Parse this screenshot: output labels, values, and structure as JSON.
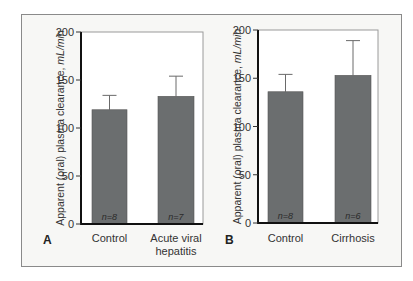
{
  "chart_data": [
    {
      "type": "bar",
      "panel": "A",
      "title": "",
      "ylabel": "Apparent (oral) plasma clearance, mL/min",
      "ylabel_plain": "Apparent (oral) plasma clearance, ",
      "ylabel_unit": "mL/min",
      "xlabel": "",
      "ylim": [
        0,
        200
      ],
      "yticks": [
        0,
        50,
        100,
        150,
        200
      ],
      "categories": [
        "Control",
        "Acute viral hepatitis"
      ],
      "category_lines": [
        [
          "Control"
        ],
        [
          "Acute viral",
          "hepatitis"
        ]
      ],
      "values": [
        119,
        133
      ],
      "error_upper": [
        134,
        154
      ],
      "n": [
        "n=8",
        "n=7"
      ],
      "grid": false,
      "bar_color": "#6b6e6f"
    },
    {
      "type": "bar",
      "panel": "B",
      "title": "",
      "ylabel": "Apparent (oral) plasma clearance, mL/min",
      "ylabel_plain": "Apparent (oral) plasma clearance, ",
      "ylabel_unit": "mL/min",
      "xlabel": "",
      "ylim": [
        0,
        200
      ],
      "yticks": [
        0,
        50,
        100,
        150,
        200
      ],
      "categories": [
        "Control",
        "Cirrhosis"
      ],
      "category_lines": [
        [
          "Control"
        ],
        [
          "Cirrhosis"
        ]
      ],
      "values": [
        136,
        153
      ],
      "error_upper": [
        154,
        189
      ],
      "n": [
        "n=8",
        "n=6"
      ],
      "grid": false,
      "bar_color": "#6b6e6f"
    }
  ],
  "panels": {
    "a": {
      "letter": "A"
    },
    "b": {
      "letter": "B"
    }
  }
}
